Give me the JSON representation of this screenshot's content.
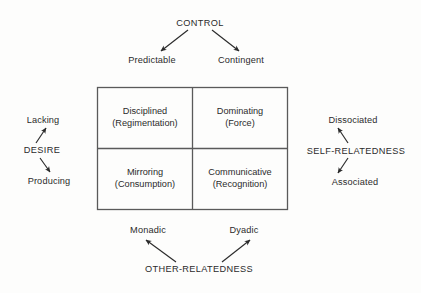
{
  "diagram": {
    "title_axes": {
      "top": "CONTROL",
      "left": "DESIRE",
      "right": "SELF-RELATEDNESS",
      "bottom": "OTHER-RELATEDNESS"
    },
    "poles": {
      "top_left": "Predictable",
      "top_right": "Contingent",
      "left_upper": "Lacking",
      "left_lower": "Producing",
      "right_upper": "Dissociated",
      "right_lower": "Associated",
      "bottom_left": "Monadic",
      "bottom_right": "Dyadic"
    },
    "quadrants": [
      {
        "id": "top-left",
        "name": "Disciplined",
        "qualifier": "(Regimentation)"
      },
      {
        "id": "top-right",
        "name": "Dominating",
        "qualifier": "(Force)"
      },
      {
        "id": "bottom-left",
        "name": "Mirroring",
        "qualifier": "(Consumption)"
      },
      {
        "id": "bottom-right",
        "name": "Communicative",
        "qualifier": "(Recognition)"
      }
    ],
    "colors": {
      "background": "#fdfdfc",
      "ink": "#2b2b2b",
      "rule": "#5a5a5a"
    }
  }
}
